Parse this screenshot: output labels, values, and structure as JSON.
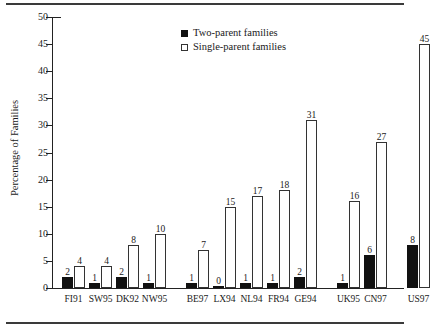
{
  "figure": {
    "rules": {
      "top": "horizontal-rule",
      "bottom": "horizontal-rule"
    }
  },
  "legend": {
    "position": "top-center",
    "entries": [
      {
        "label": "Two-parent families",
        "marker": "filled-square",
        "color": "#111111"
      },
      {
        "label": "Single-parent families",
        "marker": "open-square",
        "color": "#ffffff"
      }
    ]
  },
  "chart_data": {
    "type": "bar",
    "title": "",
    "subtitle": "",
    "xlabel": "",
    "ylabel": "Percentage of Families",
    "ylim": [
      0,
      50
    ],
    "yticks": [
      0,
      5,
      10,
      15,
      20,
      25,
      30,
      35,
      40,
      45,
      50
    ],
    "ytick_labels": [
      "0",
      "5",
      "10",
      "15",
      "20",
      "25",
      "30",
      "35",
      "40",
      "45",
      "50"
    ],
    "grid": false,
    "legend_position": "top-center",
    "categories": [
      "FI91",
      "SW95",
      "DK92",
      "NW95",
      "BE97",
      "LX94",
      "NL94",
      "FR94",
      "GE94",
      "UK95",
      "CN97",
      "US97"
    ],
    "groups": [
      {
        "name": "group-1",
        "categories": [
          "FI91",
          "SW95",
          "DK92",
          "NW95"
        ]
      },
      {
        "name": "group-2",
        "categories": [
          "BE97",
          "LX94",
          "NL94",
          "FR94",
          "GE94"
        ]
      },
      {
        "name": "group-3",
        "categories": [
          "UK95",
          "CN97"
        ]
      },
      {
        "name": "group-4",
        "categories": [
          "US97"
        ]
      }
    ],
    "series": [
      {
        "name": "Two-parent families",
        "marker": "filled-square",
        "color": "#111111",
        "values": [
          2,
          1,
          2,
          1,
          1,
          0,
          1,
          1,
          2,
          1,
          6,
          8
        ],
        "labels": [
          "2",
          "1",
          "2",
          "1",
          "1",
          "0",
          "1",
          "1",
          "2",
          "1",
          "6",
          "8"
        ]
      },
      {
        "name": "Single-parent families",
        "marker": "open-square",
        "color": "#ffffff",
        "values": [
          4,
          4,
          8,
          10,
          7,
          15,
          17,
          18,
          31,
          16,
          27,
          45
        ],
        "labels": [
          "4",
          "4",
          "8",
          "10",
          "7",
          "15",
          "17",
          "18",
          "31",
          "16",
          "27",
          "45"
        ]
      }
    ]
  }
}
